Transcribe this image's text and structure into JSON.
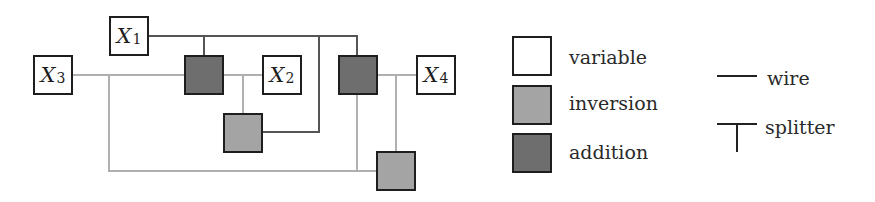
{
  "diagram": {
    "variables": [
      {
        "id": "X1",
        "letter": "X",
        "index": "1"
      },
      {
        "id": "X2",
        "letter": "X",
        "index": "2"
      },
      {
        "id": "X3",
        "letter": "X",
        "index": "3"
      },
      {
        "id": "X4",
        "letter": "X",
        "index": "4"
      }
    ],
    "gates": [
      {
        "id": "add1",
        "type": "addition"
      },
      {
        "id": "inv1",
        "type": "inversion"
      },
      {
        "id": "add2",
        "type": "addition"
      },
      {
        "id": "inv2",
        "type": "inversion"
      }
    ],
    "colors": {
      "variable_fill": "#ffffff",
      "inversion_fill": "#a4a4a4",
      "addition_fill": "#6e6e6e",
      "dark_wire": "#555555",
      "light_wire": "#b0b0b0",
      "border": "#1e1e1e"
    }
  },
  "legend": {
    "variable": "variable",
    "inversion": "inversion",
    "addition": "addition",
    "wire": "wire",
    "splitter": "splitter"
  }
}
